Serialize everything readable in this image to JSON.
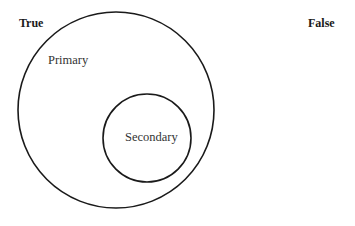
{
  "diagram": {
    "type": "euler",
    "labels": {
      "true": "True",
      "false": "False",
      "primary": "Primary",
      "secondary": "Secondary"
    },
    "stroke_color": "#1a1a1a",
    "background": "#ffffff"
  }
}
